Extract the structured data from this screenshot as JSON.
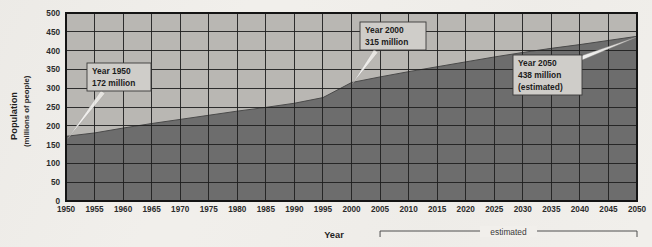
{
  "chart_data": {
    "type": "area",
    "title": "",
    "xlabel": "Year",
    "ylabel": "Population",
    "ylabel_sub": "(millions of people)",
    "xlim": [
      1950,
      2050
    ],
    "ylim": [
      0,
      500
    ],
    "ytick_step": 50,
    "xtick_step": 5,
    "grid": true,
    "legend": "none",
    "xticks": [
      "1950",
      "1955",
      "1960",
      "1965",
      "1970",
      "1975",
      "1980",
      "1985",
      "1990",
      "1995",
      "2000",
      "2005",
      "2010",
      "2015",
      "2020",
      "2025",
      "2030",
      "2035",
      "2040",
      "2045",
      "2050"
    ],
    "yticks": [
      "0",
      "50",
      "100",
      "150",
      "200",
      "250",
      "300",
      "350",
      "400",
      "450",
      "500"
    ],
    "x": [
      1950,
      1955,
      1960,
      1965,
      1970,
      1975,
      1980,
      1985,
      1990,
      1995,
      2000,
      2005,
      2010,
      2015,
      2020,
      2025,
      2030,
      2035,
      2040,
      2045,
      2050
    ],
    "values": [
      172,
      181,
      194,
      206,
      217,
      228,
      239,
      249,
      260,
      275,
      315,
      330,
      344,
      357,
      370,
      383,
      395,
      406,
      416,
      427,
      438
    ],
    "series": [
      {
        "name": "Population",
        "values": [
          172,
          181,
          194,
          206,
          217,
          228,
          239,
          249,
          260,
          275,
          315,
          330,
          344,
          357,
          370,
          383,
          395,
          406,
          416,
          427,
          438
        ]
      }
    ],
    "annotations": [
      {
        "id": "callout-1950",
        "line1": "Year 1950",
        "line2": "172 million",
        "line3": "",
        "point_x": 1950,
        "point_y": 172
      },
      {
        "id": "callout-2000",
        "line1": "Year 2000",
        "line2": "315 million",
        "line3": "",
        "point_x": 2000,
        "point_y": 315
      },
      {
        "id": "callout-2050",
        "line1": "Year 2050",
        "line2": "438 million",
        "line3": "(estimated)",
        "point_x": 2050,
        "point_y": 438
      }
    ],
    "bracket": {
      "label": "estimated",
      "from": 2005,
      "to": 2050
    },
    "colors": {
      "background": "#f1efeb",
      "plot_upper_fill": "#b9b7b3",
      "plot_area_fill": "#6e6e6e",
      "gridline": "#1e1e1e",
      "axis": "#1a1a1a",
      "callout_fill": "#cfcdc9",
      "callout_border": "#3a3a3a",
      "leader_line": "#f4f3f0",
      "text": "#1f1f1f"
    }
  }
}
